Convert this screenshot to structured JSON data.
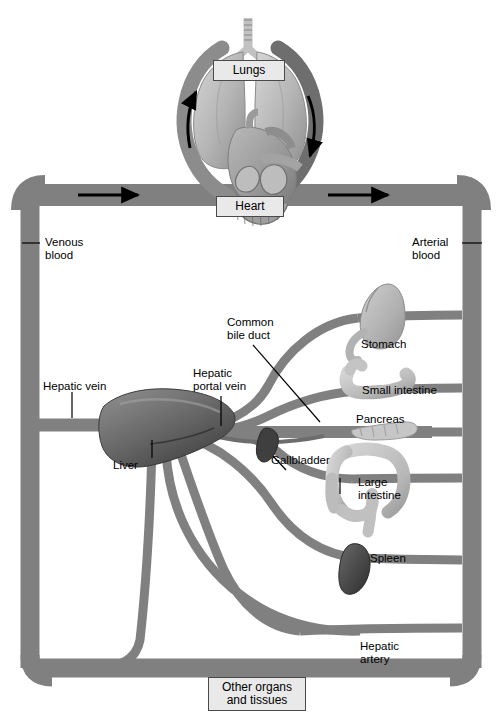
{
  "figure": {
    "background_color": "#ffffff",
    "vessel_color": "#808080",
    "vessel_color_dark": "#6f6f6f",
    "organ_color_light": "#c9c9c9",
    "organ_color_mid": "#a8a8a8",
    "organ_color_dark": "#4a4a4a",
    "label_box_fill": "#e9e9e9",
    "label_box_border": "#4a4a4a"
  },
  "boxed_labels": [
    {
      "id": "lungs",
      "text": "Lungs"
    },
    {
      "id": "heart",
      "text": "Heart"
    },
    {
      "id": "other-organs",
      "text": "Other organs\nand tissues"
    }
  ],
  "labels": [
    {
      "id": "venous-blood",
      "text": "Venous\nblood"
    },
    {
      "id": "arterial-blood",
      "text": "Arterial\nblood"
    },
    {
      "id": "hepatic-vein",
      "text": "Hepatic vein"
    },
    {
      "id": "hepatic-portal-vein",
      "text": "Hepatic\nportal vein"
    },
    {
      "id": "common-bile-duct",
      "text": "Common\nbile duct"
    },
    {
      "id": "liver",
      "text": "Liver"
    },
    {
      "id": "gallbladder",
      "text": "Gallbladder"
    },
    {
      "id": "stomach",
      "text": "Stomach"
    },
    {
      "id": "small-intestine",
      "text": "Small intestine"
    },
    {
      "id": "pancreas",
      "text": "Pancreas"
    },
    {
      "id": "large-intestine",
      "text": "Large\nintestine"
    },
    {
      "id": "spleen",
      "text": "Spleen"
    },
    {
      "id": "hepatic-artery",
      "text": "Hepatic\nartery"
    }
  ],
  "organs": [
    {
      "id": "lungs",
      "name": "lungs-illustration"
    },
    {
      "id": "heart",
      "name": "heart-illustration"
    },
    {
      "id": "liver",
      "name": "liver-illustration"
    },
    {
      "id": "gallbladder",
      "name": "gallbladder-illustration"
    },
    {
      "id": "stomach",
      "name": "stomach-illustration"
    },
    {
      "id": "small-intestine",
      "name": "small-intestine-illustration"
    },
    {
      "id": "pancreas",
      "name": "pancreas-illustration"
    },
    {
      "id": "large-intestine",
      "name": "large-intestine-illustration"
    },
    {
      "id": "spleen",
      "name": "spleen-illustration"
    }
  ],
  "flow_arrows": [
    {
      "id": "arrow-venous-right",
      "direction": "right",
      "side": "left-trunk"
    },
    {
      "id": "arrow-arterial-right",
      "direction": "right",
      "side": "right-trunk"
    },
    {
      "id": "arrow-pulmonary-left",
      "direction": "up",
      "side": "lung-left"
    },
    {
      "id": "arrow-pulmonary-right",
      "direction": "down",
      "side": "lung-right"
    }
  ]
}
